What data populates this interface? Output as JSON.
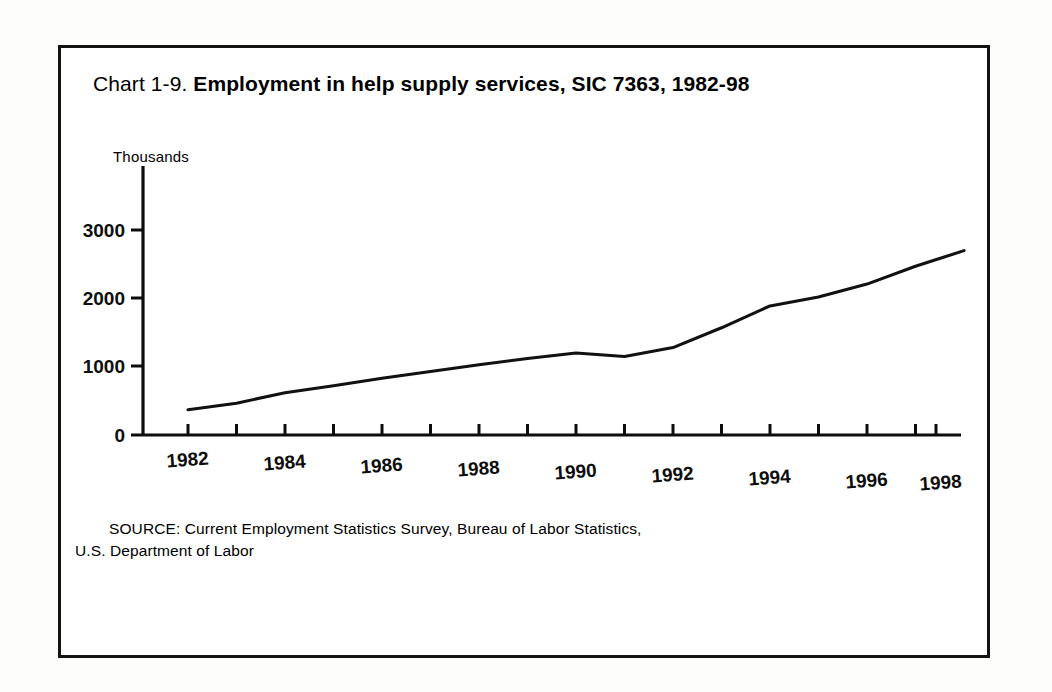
{
  "title": {
    "prefix": "Chart 1-9.",
    "main": "Employment in help supply services, SIC 7363, 1982-98"
  },
  "axis": {
    "y_unit": "Thousands",
    "y_ticks": [
      "0",
      "1000",
      "2000",
      "3000"
    ],
    "x_ticks": [
      "1982",
      "1984",
      "1986",
      "1988",
      "1990",
      "1992",
      "1994",
      "1996",
      "1998"
    ]
  },
  "source": {
    "line1": "SOURCE: Current Employment Statistics Survey, Bureau of Labor Statistics,",
    "line2": "U.S. Department of Labor"
  },
  "colors": {
    "ink": "#0d0d0d",
    "frame": "#141414",
    "paper": "#ffffff"
  },
  "chart_data": {
    "type": "line",
    "title": "Chart 1-9. Employment in help supply services, SIC 7363, 1982-98",
    "xlabel": "",
    "ylabel": "Thousands",
    "xlim": [
      1982,
      1998
    ],
    "ylim": [
      0,
      3300
    ],
    "yticks": [
      0,
      1000,
      2000,
      3000
    ],
    "xticks": [
      1982,
      1984,
      1986,
      1988,
      1990,
      1992,
      1994,
      1996,
      1998
    ],
    "grid": false,
    "legend": "none",
    "x": [
      1982,
      1983,
      1984,
      1985,
      1986,
      1987,
      1988,
      1989,
      1990,
      1991,
      1992,
      1993,
      1994,
      1995,
      1996,
      1997,
      1998
    ],
    "values": [
      370,
      465,
      620,
      720,
      830,
      930,
      1030,
      1120,
      1200,
      1150,
      1280,
      1570,
      1890,
      2020,
      2210,
      2470,
      2700
    ],
    "series": [
      {
        "name": "Help supply services employment",
        "values": [
          370,
          465,
          620,
          720,
          830,
          930,
          1030,
          1120,
          1200,
          1150,
          1280,
          1570,
          1890,
          2020,
          2210,
          2470,
          2700
        ]
      }
    ]
  }
}
